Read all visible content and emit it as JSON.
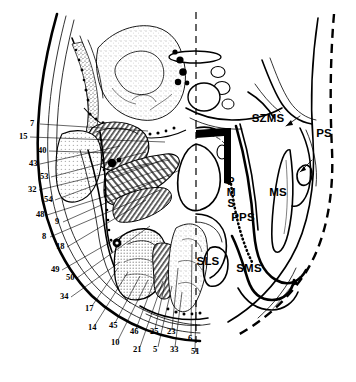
{
  "figure": {
    "type": "anatomical-line-drawing"
  },
  "space_labels": [
    {
      "id": "szms",
      "text": "SZMS",
      "x": 268,
      "y": 122,
      "meaning": "superficial-zygomatic-masticator-space"
    },
    {
      "id": "ps",
      "text": "PS",
      "x": 324,
      "y": 137,
      "meaning": "parotid-space"
    },
    {
      "id": "ms",
      "text": "MS",
      "x": 278,
      "y": 196,
      "meaning": "masticator-space"
    },
    {
      "id": "pps",
      "text": "PPS",
      "x": 243,
      "y": 221,
      "meaning": "parapharyngeal-space"
    },
    {
      "id": "sls",
      "text": "SLS",
      "x": 208,
      "y": 265,
      "meaning": "sublingual-space"
    },
    {
      "id": "sms",
      "text": "SMS",
      "x": 249,
      "y": 272,
      "meaning": "submandibular-space"
    }
  ],
  "stacked_label": {
    "id": "pms",
    "letters": [
      "P",
      "M",
      "S"
    ],
    "x": 231,
    "y_start": 185,
    "line_height": 11,
    "meaning": "pharyngeal-mucosal-space"
  },
  "numeric_labels_left": [
    {
      "n": "7",
      "tx": 30,
      "ty": 126,
      "lx": 40,
      "ly": 124,
      "ex": 148,
      "ey": 131
    },
    {
      "n": "15",
      "tx": 19,
      "ty": 139,
      "lx": 30,
      "ly": 137,
      "ex": 165,
      "ey": 142
    },
    {
      "n": "40",
      "tx": 38,
      "ty": 153,
      "lx": 49,
      "ly": 151,
      "ex": 112,
      "ey": 153
    },
    {
      "n": "43",
      "tx": 29,
      "ty": 166,
      "lx": 40,
      "ly": 164,
      "ex": 120,
      "ey": 146
    },
    {
      "n": "53",
      "tx": 40,
      "ty": 179,
      "lx": 51,
      "ly": 177,
      "ex": 146,
      "ey": 152
    },
    {
      "n": "32",
      "tx": 28,
      "ty": 192,
      "lx": 39,
      "ly": 190,
      "ex": 150,
      "ey": 163
    },
    {
      "n": "54",
      "tx": 44,
      "ty": 202,
      "lx": 55,
      "ly": 200,
      "ex": 168,
      "ey": 158
    },
    {
      "n": "48",
      "tx": 36,
      "ty": 217,
      "lx": 47,
      "ly": 215,
      "ex": 163,
      "ey": 178
    },
    {
      "n": "9",
      "tx": 55,
      "ty": 224,
      "lx": 63,
      "ly": 222,
      "ex": 180,
      "ey": 170
    },
    {
      "n": "8",
      "tx": 42,
      "ty": 239,
      "lx": 50,
      "ly": 237,
      "ex": 160,
      "ey": 190
    },
    {
      "n": "18",
      "tx": 56,
      "ty": 249,
      "lx": 67,
      "ly": 247,
      "ex": 146,
      "ey": 200
    },
    {
      "n": "49",
      "tx": 51,
      "ty": 272,
      "lx": 62,
      "ly": 270,
      "ex": 128,
      "ey": 232
    },
    {
      "n": "50",
      "tx": 66,
      "ty": 280,
      "lx": 77,
      "ly": 278,
      "ex": 150,
      "ey": 226
    },
    {
      "n": "34",
      "tx": 60,
      "ty": 299,
      "lx": 71,
      "ly": 297,
      "ex": 120,
      "ey": 262
    },
    {
      "n": "17",
      "tx": 85,
      "ty": 311,
      "lx": 92,
      "ly": 306,
      "ex": 118,
      "ey": 268
    },
    {
      "n": "14",
      "tx": 88,
      "ty": 330,
      "lx": 95,
      "ly": 325,
      "ex": 128,
      "ey": 272
    }
  ],
  "numeric_labels_bottom": [
    {
      "n": "45",
      "tx": 109,
      "ty": 328,
      "lx": 115,
      "ly": 323,
      "ex": 140,
      "ey": 276
    },
    {
      "n": "10",
      "tx": 111,
      "ty": 345,
      "lx": 118,
      "ly": 340,
      "ex": 148,
      "ey": 280
    },
    {
      "n": "46",
      "tx": 130,
      "ty": 334,
      "lx": 136,
      "ly": 329,
      "ex": 156,
      "ey": 276
    },
    {
      "n": "21",
      "tx": 133,
      "ty": 352,
      "lx": 140,
      "ly": 347,
      "ex": 163,
      "ey": 281
    },
    {
      "n": "25",
      "tx": 150,
      "ty": 334,
      "lx": 155,
      "ly": 329,
      "ex": 168,
      "ey": 270
    },
    {
      "n": "5",
      "tx": 153,
      "ty": 352,
      "lx": 158,
      "ly": 347,
      "ex": 172,
      "ey": 286
    },
    {
      "n": "23",
      "tx": 167,
      "ty": 334,
      "lx": 172,
      "ly": 329,
      "ex": 178,
      "ey": 268
    },
    {
      "n": "33",
      "tx": 170,
      "ty": 352,
      "lx": 175,
      "ly": 347,
      "ex": 182,
      "ey": 292
    },
    {
      "n": "6",
      "tx": 188,
      "ty": 341,
      "lx": 191,
      "ly": 336,
      "ex": 192,
      "ey": 244
    },
    {
      "n": "51",
      "tx": 191,
      "ty": 354,
      "lx": 195,
      "ly": 349,
      "ex": 196,
      "ey": 300
    }
  ]
}
